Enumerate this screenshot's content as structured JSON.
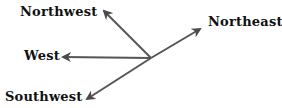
{
  "diagram": {
    "type": "compass-directions",
    "center": {
      "x": 151,
      "y": 58
    },
    "arrow_color": "#555555",
    "labels": {
      "northwest": "Northwest",
      "northeast": "Northeast",
      "west": "West",
      "southwest": "Southwest"
    },
    "arrows": [
      {
        "direction": "northwest",
        "tip": {
          "x": 103,
          "y": 10
        }
      },
      {
        "direction": "northeast",
        "tip": {
          "x": 201,
          "y": 28
        }
      },
      {
        "direction": "west",
        "tip": {
          "x": 62,
          "y": 57
        }
      },
      {
        "direction": "southwest",
        "tip": {
          "x": 86,
          "y": 100
        }
      }
    ]
  }
}
